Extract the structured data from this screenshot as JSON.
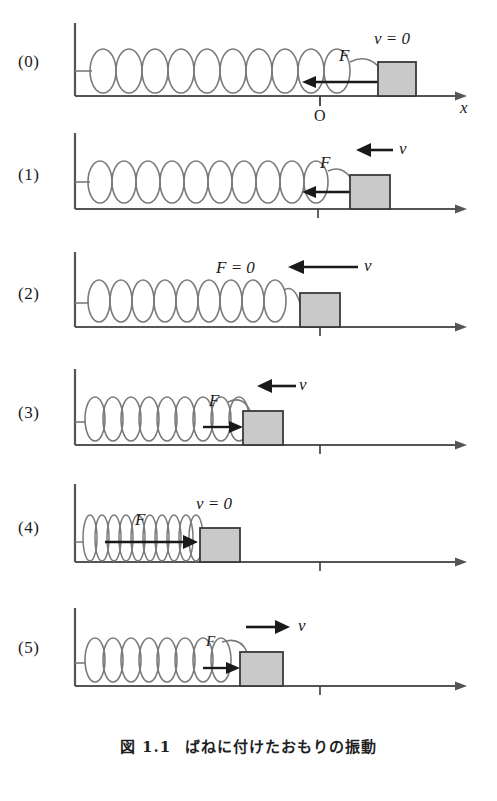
{
  "figure": {
    "caption_label": "図 1.1",
    "caption_text": "ばねに付けたおもりの振動",
    "axis_origin_label": "O",
    "axis_x_label": "x"
  },
  "colors": {
    "ink": "#2b2b2b",
    "spring": "#7a7a7a",
    "block_fill": "#c9c9c9",
    "block_stroke": "#3a3a3a",
    "baseline": "#555555",
    "background": "#ffffff"
  },
  "panels": [
    {
      "label": "(0)",
      "state_label": "v = 0",
      "force_label": "F",
      "force_direction": "left",
      "velocity_direction": "none",
      "spring_state": "stretched",
      "block_x": 378,
      "block_w": 38,
      "show_axis_labels": true
    },
    {
      "label": "(1)",
      "state_label": "v",
      "force_label": "F",
      "force_direction": "left",
      "velocity_direction": "left",
      "spring_state": "stretched",
      "block_x": 350,
      "block_w": 40,
      "show_axis_labels": false
    },
    {
      "label": "(2)",
      "state_label": "v",
      "force_label": "F = 0",
      "force_direction": "none",
      "velocity_direction": "left",
      "spring_state": "natural",
      "block_x": 300,
      "block_w": 40,
      "show_axis_labels": false
    },
    {
      "label": "(3)",
      "state_label": "v",
      "force_label": "F",
      "force_direction": "right",
      "velocity_direction": "left",
      "spring_state": "compressed",
      "block_x": 243,
      "block_w": 40,
      "show_axis_labels": false
    },
    {
      "label": "(4)",
      "state_label": "v = 0",
      "force_label": "F",
      "force_direction": "right",
      "velocity_direction": "none",
      "spring_state": "fully-compressed",
      "block_x": 200,
      "block_w": 40,
      "show_axis_labels": false
    },
    {
      "label": "(5)",
      "state_label": "v",
      "force_label": "F",
      "force_direction": "right",
      "velocity_direction": "right",
      "spring_state": "compressed",
      "block_x": 240,
      "block_w": 43,
      "show_axis_labels": false
    }
  ]
}
